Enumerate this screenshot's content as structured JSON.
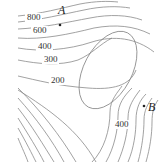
{
  "figure": {
    "type": "contour-map",
    "contour_labels": [
      {
        "value": "800",
        "x": 27,
        "y": 20
      },
      {
        "value": "600",
        "x": 33,
        "y": 33
      },
      {
        "value": "400",
        "x": 38,
        "y": 49
      },
      {
        "value": "300",
        "x": 44,
        "y": 62
      },
      {
        "value": "200",
        "x": 51,
        "y": 83
      },
      {
        "value": "400",
        "x": 115,
        "y": 127
      }
    ],
    "points": [
      {
        "label": "A",
        "x": 59,
        "y": 24
      },
      {
        "label": "B",
        "x": 143,
        "y": 108
      }
    ],
    "colors": {
      "contour": "#8a8a8a",
      "text": "#333333"
    }
  }
}
